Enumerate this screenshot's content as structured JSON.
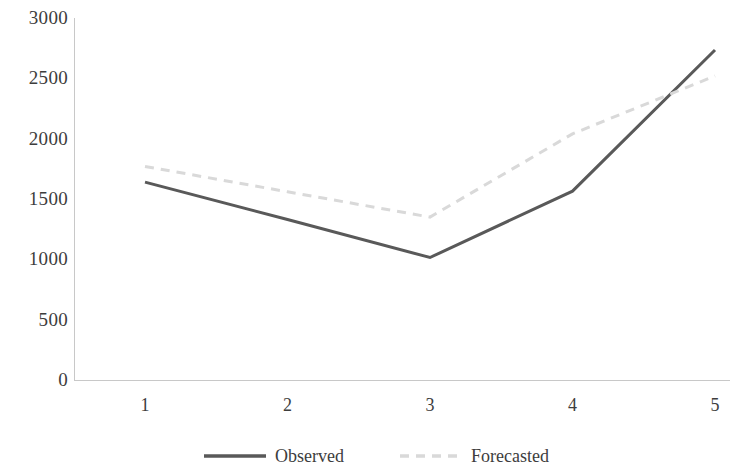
{
  "chart_data": {
    "type": "line",
    "title": "",
    "subtitle": "",
    "xlabel": "",
    "ylabel": "",
    "x": [
      1,
      2,
      3,
      4,
      5
    ],
    "categories": [
      "1",
      "2",
      "3",
      "4",
      "5"
    ],
    "series": [
      {
        "name": "Observed",
        "values": [
          1640,
          1330,
          1015,
          1565,
          2735
        ],
        "color": "#595959",
        "style": "solid",
        "width": 3
      },
      {
        "name": "Forecasted",
        "values": [
          1770,
          1560,
          1350,
          2040,
          2520
        ],
        "color": "#d9d9d9",
        "style": "dashed",
        "width": 3
      }
    ],
    "ylim": [
      0,
      3000
    ],
    "xlim": [
      1,
      5
    ],
    "y_ticks": [
      0,
      500,
      1000,
      1500,
      2000,
      2500,
      3000
    ],
    "y_tick_labels": [
      "0",
      "500",
      "1000",
      "1500",
      "2000",
      "2500",
      "3000"
    ],
    "x_ticks": [
      1,
      2,
      3,
      4,
      5
    ],
    "x_tick_labels": [
      "1",
      "2",
      "3",
      "4",
      "5"
    ],
    "grid": false,
    "legend_position": "bottom",
    "legend": [
      {
        "label": "Observed",
        "color": "#595959",
        "style": "solid"
      },
      {
        "label": "Forecasted",
        "color": "#d9d9d9",
        "style": "dashed"
      }
    ],
    "axis_color": "#c8c8c8",
    "text_color": "#3d3d3d",
    "background": "#ffffff"
  }
}
